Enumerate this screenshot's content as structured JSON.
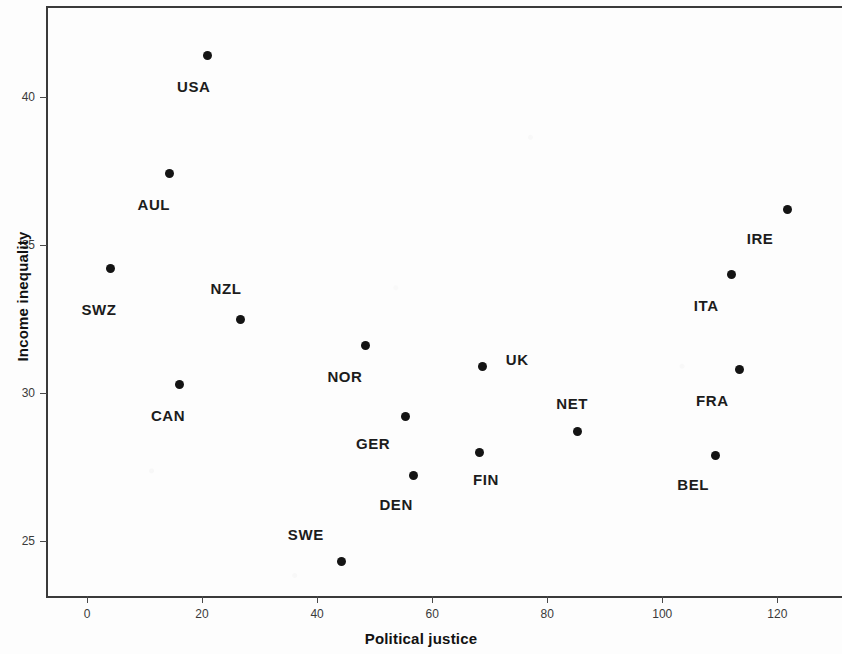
{
  "chart_data": {
    "type": "scatter",
    "title": "",
    "xlabel": "Political justice",
    "ylabel": "Income inequality",
    "xlim": [
      -8.5,
      131.0
    ],
    "ylim": [
      23.2,
      43.0
    ],
    "xticks": [
      0,
      20,
      40,
      60,
      80,
      100,
      120
    ],
    "xtick_labels": [
      "0",
      "20",
      "40",
      "60",
      "80",
      "100",
      "120"
    ],
    "yticks": [
      25,
      30,
      35,
      40
    ],
    "ytick_labels": [
      "25",
      "30",
      "35",
      "40"
    ],
    "grid": false,
    "legend": false,
    "points": [
      {
        "label": "USA",
        "x": 21.0,
        "y": 41.4,
        "label_dx": -14,
        "label_dy": 30
      },
      {
        "label": "AUL",
        "x": 14.4,
        "y": 37.4,
        "label_dx": -16,
        "label_dy": 30
      },
      {
        "label": "SWZ",
        "x": 4.0,
        "y": 34.2,
        "label_dx": -11,
        "label_dy": 40
      },
      {
        "label": "NZL",
        "x": 26.6,
        "y": 32.5,
        "label_dx": -14,
        "label_dy": -31
      },
      {
        "label": "CAN",
        "x": 16.0,
        "y": 30.3,
        "label_dx": -11,
        "label_dy": 31
      },
      {
        "label": "NOR",
        "x": 48.5,
        "y": 31.6,
        "label_dx": -21,
        "label_dy": 30
      },
      {
        "label": "GER",
        "x": 55.3,
        "y": 29.2,
        "label_dx": -32,
        "label_dy": 26
      },
      {
        "label": "DEN",
        "x": 56.7,
        "y": 27.2,
        "label_dx": -17,
        "label_dy": 28
      },
      {
        "label": "SWE",
        "x": 44.3,
        "y": 24.3,
        "label_dx": -36,
        "label_dy": -28
      },
      {
        "label": "FIN",
        "x": 68.3,
        "y": 28.0,
        "label_dx": 6,
        "label_dy": 27
      },
      {
        "label": "UK",
        "x": 68.7,
        "y": 30.9,
        "label_dx": 35,
        "label_dy": -7
      },
      {
        "label": "NET",
        "x": 85.2,
        "y": 28.7,
        "label_dx": -5,
        "label_dy": -28
      },
      {
        "label": "BEL",
        "x": 109.2,
        "y": 27.9,
        "label_dx": -22,
        "label_dy": 29
      },
      {
        "label": "FRA",
        "x": 113.4,
        "y": 30.8,
        "label_dx": -27,
        "label_dy": 31
      },
      {
        "label": "ITA",
        "x": 112.0,
        "y": 34.0,
        "label_dx": -25,
        "label_dy": 30
      },
      {
        "label": "IRE",
        "x": 121.7,
        "y": 36.2,
        "label_dx": -27,
        "label_dy": 29
      }
    ]
  }
}
